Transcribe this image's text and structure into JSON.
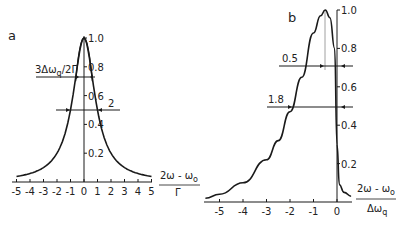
{
  "chart_data": [
    {
      "panel": "a",
      "type": "line",
      "title": "a",
      "xlabel_num": "2ω − ω₀",
      "xlabel_den": "Γ",
      "ylabel": "",
      "xlim": [
        -5,
        5
      ],
      "ylim": [
        0,
        1.0
      ],
      "xticks": [
        "-5",
        "-4",
        "-3",
        "-2",
        "-1",
        "0",
        "1",
        "2",
        "3",
        "4",
        "5"
      ],
      "yticks": [
        "0.2",
        "0.4",
        "0.6",
        "0.8",
        "1.0"
      ],
      "series": [
        {
          "name": "broad Lorentzian",
          "x": [
            -5,
            -4,
            -3,
            -2,
            -1.5,
            -1,
            -0.5,
            -0.2,
            0,
            0.2,
            0.5,
            1,
            1.5,
            2,
            3,
            4,
            5
          ],
          "y": [
            0.04,
            0.06,
            0.1,
            0.2,
            0.31,
            0.5,
            0.8,
            0.96,
            1.0,
            0.96,
            0.8,
            0.5,
            0.31,
            0.2,
            0.1,
            0.06,
            0.04
          ]
        },
        {
          "name": "narrow line",
          "x": [
            -0.6,
            -0.4,
            -0.2,
            0,
            0.2,
            0.4,
            0.6
          ],
          "y": [
            0.7,
            0.85,
            0.97,
            1.0,
            0.97,
            0.85,
            0.7
          ]
        }
      ],
      "annotations": [
        {
          "text": "3Δω_q/2Γ",
          "y": 0.72,
          "x_from": -3.6,
          "x_to": 0.8
        },
        {
          "text": "2",
          "y": 0.5,
          "x_from": -2.1,
          "x_to": 2.6
        }
      ],
      "grid": false
    },
    {
      "panel": "b",
      "type": "line",
      "title": "b",
      "xlabel_num": "2ω − ω₀",
      "xlabel_den": "Δω_q",
      "ylabel": "",
      "xlim": [
        -5.6,
        0.6
      ],
      "ylim": [
        0,
        1.0
      ],
      "xticks": [
        "-5",
        "-4",
        "-3",
        "-2",
        "-1",
        "0"
      ],
      "yticks": [
        "0.2",
        "0.4",
        "0.6",
        "0.8",
        "1.0"
      ],
      "series": [
        {
          "name": "asymmetric lineshape",
          "x": [
            -5.6,
            -5,
            -4,
            -3,
            -2.5,
            -2,
            -1.5,
            -1,
            -0.7,
            -0.5,
            -0.3,
            -0.1,
            0,
            0.1,
            0.3,
            0.6
          ],
          "y": [
            0.02,
            0.04,
            0.1,
            0.22,
            0.32,
            0.47,
            0.65,
            0.88,
            0.97,
            1.0,
            0.96,
            0.8,
            0.3,
            0.09,
            0.05,
            0.03
          ]
        }
      ],
      "annotations": [
        {
          "text": "0.5",
          "y": 0.71,
          "x_from": -2.5,
          "x_to": 0.5
        },
        {
          "text": "1.8",
          "y": 0.5,
          "x_from": -3.0,
          "x_to": 0.5
        }
      ],
      "grid": false
    }
  ],
  "labels": {
    "panel_a": "a",
    "panel_b": "b",
    "ann_a1": "3Δω",
    "ann_a1_sub": "q",
    "ann_a1_tail": "/2Γ",
    "ann_a2": "2",
    "ann_b1": "0.5",
    "ann_b2": "1.8",
    "xlab_a_num": "2ω - ω",
    "xlab_a_num_sub": "o",
    "xlab_a_den": "Γ",
    "xlab_b_num": "2ω - ω",
    "xlab_b_num_sub": "o",
    "xlab_b_den": "Δω",
    "xlab_b_den_sub": "q"
  },
  "ticks": {
    "a_x": [
      "-5",
      "-4",
      "-3",
      "-2",
      "-1",
      "0",
      "1",
      "2",
      "3",
      "4",
      "5"
    ],
    "a_y": [
      "0.2",
      "0.4",
      "0.6",
      "0.8",
      "1.0"
    ],
    "b_x": [
      "-5",
      "-4",
      "-3",
      "-2",
      "-1",
      "0"
    ],
    "b_y": [
      "0.2",
      "0.4",
      "0.6",
      "0.8",
      "1.0"
    ]
  },
  "colors": {
    "ink": "#1a1a1a",
    "background": "#ffffff"
  }
}
